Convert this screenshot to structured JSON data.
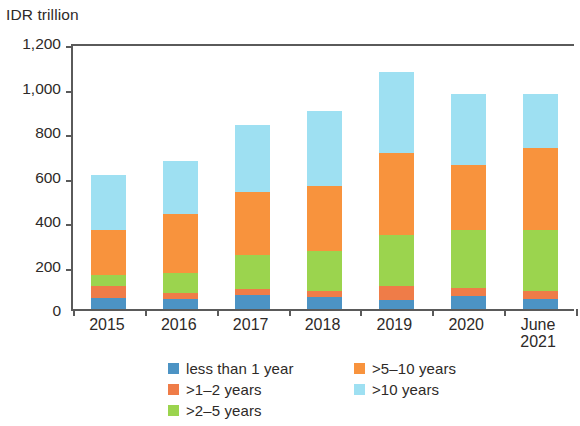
{
  "chart_data": {
    "type": "bar",
    "stacked": true,
    "title": "",
    "subtitle": "",
    "xlabel": "",
    "ylabel": "IDR trillion",
    "ylim": [
      0,
      1200
    ],
    "ytick_labels": [
      "0",
      "200",
      "400",
      "600",
      "800",
      "1,000",
      "1,200"
    ],
    "ytick_values": [
      0,
      200,
      400,
      600,
      800,
      1000,
      1200
    ],
    "grid": false,
    "legend_position": "bottom",
    "categories": [
      "2015",
      "2016",
      "2017",
      "2018",
      "2019",
      "2020",
      "June\n2021"
    ],
    "category_labels": [
      "2015",
      "2016",
      "2017",
      "2018",
      "2019",
      "2020",
      "June 2021"
    ],
    "series": [
      {
        "name": "less than 1 year",
        "color": "#4C93C4",
        "values": [
          49,
          45,
          63,
          54,
          41,
          59,
          45
        ]
      },
      {
        "name": ">1–2 years",
        "color": "#EF7C48",
        "values": [
          54,
          27,
          27,
          27,
          63,
          36,
          36
        ]
      },
      {
        "name": ">2–5 years",
        "color": "#9BD44E",
        "values": [
          49,
          90,
          153,
          179,
          229,
          260,
          274
        ]
      },
      {
        "name": ">5–10 years",
        "color": "#F8933D",
        "values": [
          203,
          265,
          283,
          293,
          367,
          292,
          368
        ]
      },
      {
        "name": ">10 years",
        "color": "#9EE0F2",
        "values": [
          248,
          238,
          301,
          337,
          365,
          318,
          245
        ]
      }
    ],
    "totals": [
      553,
      665,
      827,
      890,
      1065,
      965,
      968
    ]
  },
  "legend": {
    "entries": [
      {
        "label": "less than 1 year",
        "color": "#4C93C4"
      },
      {
        "label": ">1–2 years",
        "color": "#EF7C48"
      },
      {
        "label": ">2–5 years",
        "color": "#9BD44E"
      },
      {
        "label": ">5–10 years",
        "color": "#F8933D"
      },
      {
        "label": ">10 years",
        "color": "#9EE0F2"
      }
    ]
  },
  "colors": {
    "axis": "#5a5a5a",
    "text": "#2e2a28",
    "background": "#ffffff"
  }
}
